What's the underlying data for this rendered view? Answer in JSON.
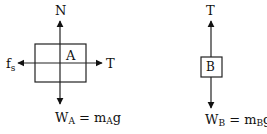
{
  "diagram": {
    "colors": {
      "ink": "#111111",
      "background": "#ffffff"
    },
    "block_a": {
      "label": "A",
      "forces": {
        "up": {
          "label": "N"
        },
        "left": {
          "label": "f",
          "sub": "s"
        },
        "right": {
          "label": "T"
        },
        "down": {
          "label": "W",
          "sub": "A",
          "eq": " = m",
          "eq_sub": "A",
          "tail": "g"
        }
      }
    },
    "block_b": {
      "label": "B",
      "forces": {
        "up": {
          "label": "T"
        },
        "down": {
          "label": "W",
          "sub": "B",
          "eq": " = m",
          "eq_sub": "B",
          "tail": "g"
        }
      }
    }
  }
}
